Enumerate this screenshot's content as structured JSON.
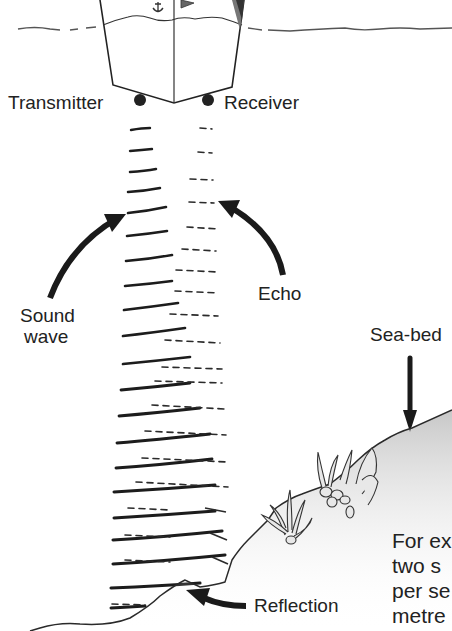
{
  "diagram": {
    "labels": {
      "transmitter": "Transmitter",
      "receiver": "Receiver",
      "sound_wave_line1": "Sound",
      "sound_wave_line2": "wave",
      "echo": "Echo",
      "sea_bed": "Sea-bed",
      "reflection": "Reflection"
    },
    "caption_fragment": [
      "For ex",
      "two s",
      "per se",
      "metre"
    ],
    "icons": [
      "boat-hull",
      "anchor-emblem",
      "flag-emblem",
      "transmitter-dot",
      "receiver-dot",
      "sound-wave-arrow",
      "echo-arrow",
      "sea-bed-arrow",
      "reflection-arrow",
      "seaweed"
    ]
  }
}
